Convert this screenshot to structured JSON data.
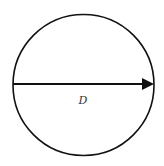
{
  "diagram": {
    "shape": "circle",
    "center": [
      83.5,
      85
    ],
    "radius": 70,
    "stroke_color": "#111111",
    "arrow": {
      "from": [
        13,
        84
      ],
      "to": [
        154,
        84
      ],
      "label": "D"
    },
    "label_position": [
      83,
      104
    ]
  }
}
